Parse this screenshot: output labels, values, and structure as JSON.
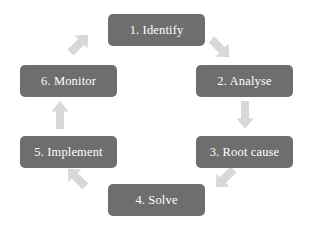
{
  "diagram": {
    "type": "cycle",
    "direction": "clockwise",
    "background_color": "#ffffff",
    "node_color": "#6e6e6e",
    "node_text_color": "#ffffff",
    "arrow_color": "#d8d8d8",
    "nodes": [
      {
        "id": 1,
        "label": "1. Identify"
      },
      {
        "id": 2,
        "label": "2. Analyse"
      },
      {
        "id": 3,
        "label": "3. Root cause"
      },
      {
        "id": 4,
        "label": "4. Solve"
      },
      {
        "id": 5,
        "label": "5. Implement"
      },
      {
        "id": 6,
        "label": "6. Monitor"
      }
    ],
    "arrows": [
      {
        "id": "monitor-identify",
        "from": "6. Monitor",
        "to": "1. Identify",
        "direction": "up-right"
      },
      {
        "id": "identify-analyse",
        "from": "1. Identify",
        "to": "2. Analyse",
        "direction": "down-right"
      },
      {
        "id": "analyse-root",
        "from": "2. Analyse",
        "to": "3. Root cause",
        "direction": "down"
      },
      {
        "id": "root-solve",
        "from": "3. Root cause",
        "to": "4. Solve",
        "direction": "down-left"
      },
      {
        "id": "solve-implement",
        "from": "4. Solve",
        "to": "5. Implement",
        "direction": "up-left"
      },
      {
        "id": "implement-monitor",
        "from": "5. Implement",
        "to": "6. Monitor",
        "direction": "up"
      }
    ]
  }
}
